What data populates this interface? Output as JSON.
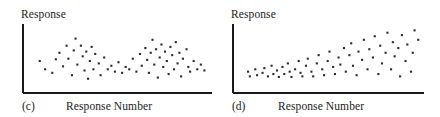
{
  "figure": {
    "background_color": "#ffffff",
    "axis_color": "#1a1a1a",
    "marker_color": "#2b2b2b",
    "panels": [
      {
        "id": "c",
        "letter": "(c)",
        "y_axis_label": "Response",
        "x_axis_label": "Response Number"
      },
      {
        "id": "d",
        "letter": "(d)",
        "y_axis_label": "Response",
        "x_axis_label": "Response Number"
      }
    ]
  },
  "chart_data": [
    {
      "type": "scatter",
      "panel": "(c)",
      "title": "",
      "xlabel": "Response Number",
      "ylabel": "Response",
      "grid": false,
      "legend": "none",
      "axis_style": "left-and-bottom-spine-only",
      "ticks": {
        "x": [],
        "y": []
      },
      "xlim": [
        0,
        100
      ],
      "ylim": [
        0,
        100
      ],
      "pattern": "cyclic-two-humps",
      "points": [
        {
          "x": 6,
          "y": 44
        },
        {
          "x": 9,
          "y": 30
        },
        {
          "x": 13,
          "y": 24
        },
        {
          "x": 15,
          "y": 47
        },
        {
          "x": 17,
          "y": 58
        },
        {
          "x": 19,
          "y": 35
        },
        {
          "x": 21,
          "y": 70
        },
        {
          "x": 22,
          "y": 48
        },
        {
          "x": 24,
          "y": 20
        },
        {
          "x": 25,
          "y": 62
        },
        {
          "x": 26,
          "y": 82
        },
        {
          "x": 27,
          "y": 38
        },
        {
          "x": 29,
          "y": 70
        },
        {
          "x": 30,
          "y": 52
        },
        {
          "x": 31,
          "y": 28
        },
        {
          "x": 32,
          "y": 60
        },
        {
          "x": 33,
          "y": 14
        },
        {
          "x": 34,
          "y": 44
        },
        {
          "x": 35,
          "y": 68
        },
        {
          "x": 36,
          "y": 30
        },
        {
          "x": 37,
          "y": 56
        },
        {
          "x": 39,
          "y": 40
        },
        {
          "x": 40,
          "y": 20
        },
        {
          "x": 42,
          "y": 50
        },
        {
          "x": 44,
          "y": 30
        },
        {
          "x": 46,
          "y": 36
        },
        {
          "x": 48,
          "y": 26
        },
        {
          "x": 50,
          "y": 42
        },
        {
          "x": 52,
          "y": 24
        },
        {
          "x": 54,
          "y": 34
        },
        {
          "x": 56,
          "y": 30
        },
        {
          "x": 58,
          "y": 48
        },
        {
          "x": 60,
          "y": 26
        },
        {
          "x": 62,
          "y": 56
        },
        {
          "x": 63,
          "y": 36
        },
        {
          "x": 65,
          "y": 66
        },
        {
          "x": 66,
          "y": 46
        },
        {
          "x": 67,
          "y": 24
        },
        {
          "x": 68,
          "y": 58
        },
        {
          "x": 69,
          "y": 80
        },
        {
          "x": 70,
          "y": 38
        },
        {
          "x": 71,
          "y": 64
        },
        {
          "x": 72,
          "y": 16
        },
        {
          "x": 73,
          "y": 50
        },
        {
          "x": 74,
          "y": 72
        },
        {
          "x": 75,
          "y": 34
        },
        {
          "x": 76,
          "y": 60
        },
        {
          "x": 77,
          "y": 44
        },
        {
          "x": 78,
          "y": 22
        },
        {
          "x": 79,
          "y": 68
        },
        {
          "x": 80,
          "y": 54
        },
        {
          "x": 81,
          "y": 30
        },
        {
          "x": 82,
          "y": 76
        },
        {
          "x": 83,
          "y": 40
        },
        {
          "x": 84,
          "y": 58
        },
        {
          "x": 85,
          "y": 18
        },
        {
          "x": 86,
          "y": 48
        },
        {
          "x": 88,
          "y": 64
        },
        {
          "x": 89,
          "y": 34
        },
        {
          "x": 90,
          "y": 26
        },
        {
          "x": 92,
          "y": 44
        },
        {
          "x": 94,
          "y": 30
        },
        {
          "x": 96,
          "y": 38
        },
        {
          "x": 98,
          "y": 28
        }
      ]
    },
    {
      "type": "scatter",
      "panel": "(d)",
      "title": "",
      "xlabel": "Response Number",
      "ylabel": "Response",
      "grid": false,
      "legend": "none",
      "axis_style": "left-and-bottom-spine-only",
      "ticks": {
        "x": [],
        "y": []
      },
      "xlim": [
        0,
        100
      ],
      "ylim": [
        0,
        100
      ],
      "pattern": "increasing-variance-fan",
      "points": [
        {
          "x": 5,
          "y": 26
        },
        {
          "x": 6,
          "y": 18
        },
        {
          "x": 9,
          "y": 30
        },
        {
          "x": 10,
          "y": 20
        },
        {
          "x": 13,
          "y": 24
        },
        {
          "x": 14,
          "y": 32
        },
        {
          "x": 16,
          "y": 18
        },
        {
          "x": 18,
          "y": 36
        },
        {
          "x": 19,
          "y": 22
        },
        {
          "x": 21,
          "y": 28
        },
        {
          "x": 22,
          "y": 17
        },
        {
          "x": 24,
          "y": 34
        },
        {
          "x": 25,
          "y": 22
        },
        {
          "x": 27,
          "y": 40
        },
        {
          "x": 28,
          "y": 26
        },
        {
          "x": 29,
          "y": 17
        },
        {
          "x": 31,
          "y": 30
        },
        {
          "x": 33,
          "y": 44
        },
        {
          "x": 34,
          "y": 24
        },
        {
          "x": 35,
          "y": 18
        },
        {
          "x": 37,
          "y": 36
        },
        {
          "x": 38,
          "y": 48
        },
        {
          "x": 40,
          "y": 26
        },
        {
          "x": 41,
          "y": 18
        },
        {
          "x": 43,
          "y": 40
        },
        {
          "x": 44,
          "y": 54
        },
        {
          "x": 46,
          "y": 30
        },
        {
          "x": 47,
          "y": 20
        },
        {
          "x": 49,
          "y": 44
        },
        {
          "x": 50,
          "y": 60
        },
        {
          "x": 52,
          "y": 34
        },
        {
          "x": 53,
          "y": 22
        },
        {
          "x": 55,
          "y": 50
        },
        {
          "x": 56,
          "y": 38
        },
        {
          "x": 58,
          "y": 66
        },
        {
          "x": 59,
          "y": 26
        },
        {
          "x": 61,
          "y": 54
        },
        {
          "x": 62,
          "y": 74
        },
        {
          "x": 63,
          "y": 36
        },
        {
          "x": 65,
          "y": 20
        },
        {
          "x": 66,
          "y": 60
        },
        {
          "x": 68,
          "y": 46
        },
        {
          "x": 69,
          "y": 80
        },
        {
          "x": 71,
          "y": 30
        },
        {
          "x": 72,
          "y": 64
        },
        {
          "x": 74,
          "y": 50
        },
        {
          "x": 75,
          "y": 86
        },
        {
          "x": 77,
          "y": 22
        },
        {
          "x": 78,
          "y": 70
        },
        {
          "x": 79,
          "y": 40
        },
        {
          "x": 81,
          "y": 58
        },
        {
          "x": 82,
          "y": 92
        },
        {
          "x": 84,
          "y": 30
        },
        {
          "x": 85,
          "y": 76
        },
        {
          "x": 86,
          "y": 52
        },
        {
          "x": 88,
          "y": 66
        },
        {
          "x": 89,
          "y": 18
        },
        {
          "x": 90,
          "y": 88
        },
        {
          "x": 92,
          "y": 44
        },
        {
          "x": 93,
          "y": 72
        },
        {
          "x": 95,
          "y": 26
        },
        {
          "x": 96,
          "y": 58
        },
        {
          "x": 97,
          "y": 96
        },
        {
          "x": 99,
          "y": 80
        }
      ]
    }
  ]
}
